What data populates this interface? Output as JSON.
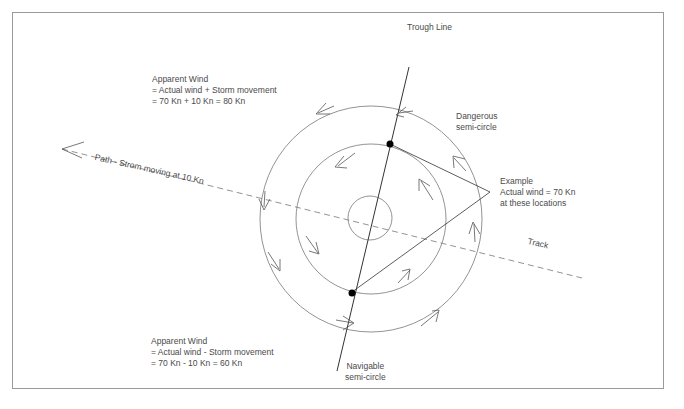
{
  "diagram": {
    "title_labels": {
      "trough_line": "Trough Line",
      "dangerous": [
        "Dangerous",
        "semi-circle"
      ],
      "navigable": [
        "Navigable",
        "semi-circle"
      ],
      "path": "Path - Strom moving at 10 Kn",
      "track": "Track"
    },
    "apparent_wind_top": {
      "line1": "Apparent Wind",
      "line2": "= Actual wind + Storm movement",
      "line3": "= 70 Kn + 10 Kn = 80 Kn"
    },
    "apparent_wind_bottom": {
      "line1": "Apparent Wind",
      "line2": "= Actual wind - Storm movement",
      "line3": "= 70 Kn - 10 Kn = 60 Kn"
    },
    "example": {
      "line1": "Example",
      "line2": "Actual wind = 70 Kn",
      "line3": "at these locations"
    },
    "storm_center": {
      "x": 371,
      "y": 219
    },
    "circles": [
      {
        "name": "eye",
        "r": 22
      },
      {
        "name": "middle",
        "r": 75
      },
      {
        "name": "outer",
        "rx": 111,
        "ry": 113
      }
    ],
    "colors": {
      "line": "#555555",
      "dark_line": "#333333",
      "dot": "#000000",
      "border": "#9a9a9a",
      "text": "#4a4a4a"
    }
  }
}
